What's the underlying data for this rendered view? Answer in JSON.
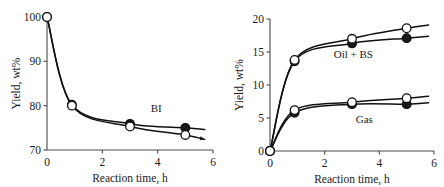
{
  "figure": {
    "panels": [
      {
        "id": "left",
        "name": "bi-yield-panel",
        "xaxis": {
          "title": "Reaction time, h",
          "ticks": [
            "0",
            "2",
            "4",
            "6"
          ],
          "values": [
            0,
            2,
            4,
            6
          ],
          "min": 0,
          "max": 6
        },
        "yaxis": {
          "title": "Yield, wt%",
          "ticks": [
            "70",
            "80",
            "90",
            "100"
          ],
          "values": [
            70,
            80,
            90,
            100
          ],
          "min": 70,
          "max": 100
        },
        "annotations": [
          {
            "text": "BI",
            "x": 3.95,
            "y": 78.6
          }
        ],
        "chart_data": {
          "type": "scatter",
          "title": "",
          "xlabel": "Reaction time, h",
          "ylabel": "Yield, wt%",
          "xlim": [
            0,
            6
          ],
          "ylim": [
            70,
            100
          ],
          "grid": false,
          "legend": "none",
          "annotations": [
            "BI"
          ],
          "series": [
            {
              "name": "BI filled-marker series",
              "marker": "filled-circle",
              "x": [
                0,
                0.9,
                3.0,
                5.0
              ],
              "y": [
                100.0,
                80.2,
                75.9,
                75.0
              ],
              "curve_end": {
                "x": 5.7,
                "y": 74.6
              },
              "arrow": false
            },
            {
              "name": "BI open-marker series",
              "marker": "open-circle",
              "x": [
                0,
                0.9,
                3.0,
                5.0
              ],
              "y": [
                100.0,
                80.0,
                75.3,
                73.4
              ],
              "curve_end": {
                "x": 5.7,
                "y": 72.4
              },
              "arrow": true
            }
          ]
        }
      },
      {
        "id": "right",
        "name": "oil-bs-gas-yield-panel",
        "xaxis": {
          "title": "Reaction time, h",
          "ticks": [
            "0",
            "2",
            "4",
            "6"
          ],
          "values": [
            0,
            2,
            4,
            6
          ],
          "min": 0,
          "max": 6
        },
        "yaxis": {
          "title": "Yield, wt%",
          "ticks": [
            "0",
            "5",
            "10",
            "15",
            "20"
          ],
          "values": [
            0,
            5,
            10,
            15,
            20
          ],
          "min": 0,
          "max": 20
        },
        "annotations": [
          {
            "text": "Oil + BS",
            "x": 3.05,
            "y": 14.1
          },
          {
            "text": "Gas",
            "x": 3.45,
            "y": 4.3
          }
        ],
        "chart_data": {
          "type": "scatter",
          "title": "",
          "xlabel": "Reaction time, h",
          "ylabel": "Yield, wt%",
          "xlim": [
            0,
            6
          ],
          "ylim": [
            0,
            20
          ],
          "grid": false,
          "legend": "none",
          "annotations": [
            "Oil + BS",
            "Gas"
          ],
          "series": [
            {
              "name": "Oil + BS open-marker series",
              "marker": "open-circle",
              "x": [
                0,
                0.9,
                3.0,
                5.0
              ],
              "y": [
                0.0,
                13.8,
                17.0,
                18.6
              ],
              "curve_end": {
                "x": 5.8,
                "y": 19.1
              },
              "arrow": false
            },
            {
              "name": "Oil + BS filled-marker series",
              "marker": "filled-circle",
              "x": [
                0,
                0.9,
                3.0,
                5.0
              ],
              "y": [
                0.0,
                13.6,
                16.3,
                17.1
              ],
              "curve_end": {
                "x": 5.8,
                "y": 17.4
              },
              "arrow": false
            },
            {
              "name": "Gas open-marker series",
              "marker": "open-circle",
              "x": [
                0,
                0.9,
                3.0,
                5.0
              ],
              "y": [
                0.0,
                6.2,
                7.4,
                8.0
              ],
              "curve_end": {
                "x": 5.8,
                "y": 8.3
              },
              "arrow": false
            },
            {
              "name": "Gas filled-marker series",
              "marker": "filled-circle",
              "x": [
                0,
                0.9,
                3.0,
                5.0
              ],
              "y": [
                0.0,
                5.8,
                7.1,
                7.1
              ],
              "curve_end": {
                "x": 5.8,
                "y": 7.3
              },
              "arrow": false
            }
          ]
        }
      }
    ]
  }
}
